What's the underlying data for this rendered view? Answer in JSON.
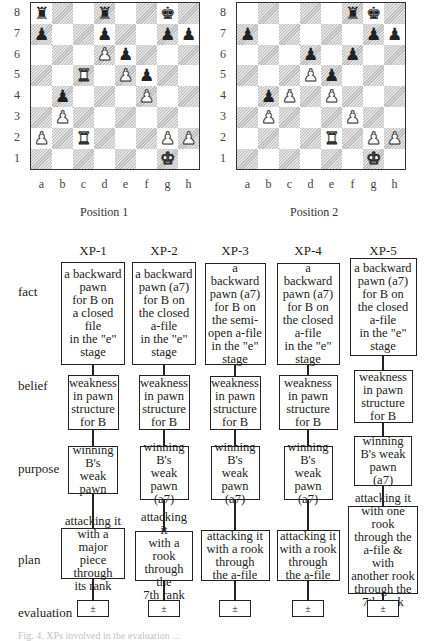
{
  "figure": {
    "positions": [
      {
        "label": "Position 1",
        "board": [
          [
            "bR",
            "",
            "",
            "bR",
            "",
            "",
            "bK",
            ""
          ],
          [
            "bP",
            "",
            "",
            "bP",
            "",
            "",
            "bP",
            "bP"
          ],
          [
            "",
            "",
            "",
            "wP",
            "bP",
            "",
            "",
            ""
          ],
          [
            "",
            "",
            "wR",
            "",
            "wP",
            "bP",
            "",
            ""
          ],
          [
            "",
            "bP",
            "",
            "",
            "",
            "wP",
            "",
            ""
          ],
          [
            "",
            "wP",
            "",
            "",
            "",
            "",
            "",
            ""
          ],
          [
            "wP",
            "",
            "wR",
            "",
            "",
            "",
            "wP",
            "wP"
          ],
          [
            "",
            "",
            "",
            "",
            "",
            "",
            "wK",
            ""
          ]
        ]
      },
      {
        "label": "Position 2",
        "board": [
          [
            "",
            "",
            "",
            "",
            "",
            "bR",
            "bK",
            ""
          ],
          [
            "bP",
            "",
            "",
            "",
            "",
            "",
            "bP",
            "bP"
          ],
          [
            "",
            "",
            "",
            "bP",
            "",
            "bP",
            "",
            ""
          ],
          [
            "",
            "",
            "",
            "wP",
            "bP",
            "",
            "",
            ""
          ],
          [
            "",
            "bP",
            "wP",
            "",
            "wP",
            "",
            "",
            ""
          ],
          [
            "",
            "wP",
            "",
            "",
            "",
            "wP",
            "",
            ""
          ],
          [
            "",
            "",
            "",
            "",
            "wR",
            "",
            "wP",
            "wP"
          ],
          [
            "",
            "",
            "",
            "",
            "",
            "",
            "wK",
            ""
          ]
        ]
      }
    ],
    "ranks": [
      "8",
      "7",
      "6",
      "5",
      "4",
      "3",
      "2",
      "1"
    ],
    "files": [
      "a",
      "b",
      "c",
      "d",
      "e",
      "f",
      "g",
      "h"
    ],
    "piece_glyphs": {
      "K": "♚",
      "Q": "♛",
      "R": "♜",
      "B": "♝",
      "N": "♞",
      "P": "♟"
    },
    "row_labels": [
      "fact",
      "belief",
      "purpose",
      "plan",
      "evaluation"
    ],
    "columns": [
      {
        "title": "XP-1",
        "fact": "a backward\npawn\nfor B on\na closed\nfile\nin the \"e\"\nstage",
        "belief": "weakness\nin pawn\nstructure\nfor B",
        "purpose": "winning\nB's weak\npawn",
        "plan": "attacking it\nwith a major\npiece through\nits rank",
        "evaluation": "±"
      },
      {
        "title": "XP-2",
        "fact": "a backward\npawn (a7)\nfor B on\nthe closed\na-file\nin the \"e\"\nstage",
        "belief": "weakness\nin pawn\nstructure\nfor B",
        "purpose": "winning\nB's weak\npawn\n(a7)",
        "plan": "attacking it\nwith a rook\nthrough the\n7th rank",
        "evaluation": "±"
      },
      {
        "title": "XP-3",
        "fact": "a backward\npawn (a7)\nfor B on\nthe semi-\nopen a-file\nin the \"e\"\nstage",
        "belief": "weakness\nin pawn\nstructure\nfor B",
        "purpose": "winning\nB's weak\npawn\n(a7)",
        "plan": "attacking it\nwith a rook\nthrough\nthe a-file",
        "evaluation": "±"
      },
      {
        "title": "XP-4",
        "fact": "a backward\npawn (a7)\nfor B on\nthe closed\na-file\nin the \"e\"\nstage",
        "belief": "weakness\nin pawn\nstructure\nfor B",
        "purpose": "winning\nB's weak\npawn\n(a7)",
        "plan": "attacking it\nwith a rook\nthrough\nthe a-file",
        "evaluation": "±"
      },
      {
        "title": "XP-5",
        "fact": "a backward\npawn (a7)\nfor B on\nthe closed\na-file\nin the \"e\"\nstage",
        "belief": "weakness\nin pawn\nstructure\nfor B",
        "purpose": "winning\nB's weak\npawn\n(a7)",
        "plan": "attacking it\nwith one rook\nthrough the\na-file & with\nanother rook\nthrough the\n7th rank",
        "evaluation": "±"
      }
    ],
    "caption_partial": "Fig. 4. XPs involved in the evaluation ..."
  }
}
